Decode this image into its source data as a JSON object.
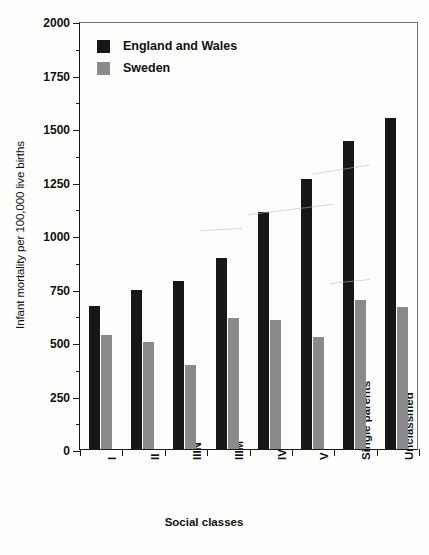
{
  "chart_data": {
    "type": "bar",
    "title": "",
    "xlabel": "Social classes",
    "ylabel": "Infant mortality per 100,000 live births",
    "categories": [
      "I",
      "II",
      "IIIN",
      "IIIM",
      "IV",
      "V",
      "Single parents",
      "Unclassified"
    ],
    "series": [
      {
        "name": "England and Wales",
        "color": "#171717",
        "values": [
          668,
          745,
          785,
          893,
          1108,
          1262,
          1437,
          1548
        ]
      },
      {
        "name": "Sweden",
        "color": "#8a8a8a",
        "values": [
          532,
          500,
          392,
          612,
          605,
          524,
          697,
          663
        ]
      }
    ],
    "ylim": [
      0,
      2000
    ],
    "yticks": [
      0,
      250,
      500,
      750,
      1000,
      1250,
      1500,
      1750,
      2000
    ],
    "ytick_labels": [
      "0",
      "250",
      "500",
      "750",
      "1000",
      "1250",
      "1500",
      "1750",
      "2000"
    ],
    "minor_ticks": true,
    "grid": false,
    "legend_position": "top-left",
    "legend": [
      "England and Wales",
      "Sweden"
    ]
  },
  "axis": {
    "y_title": "Infant mortality per 100,000 live births",
    "x_title": "Social classes"
  }
}
